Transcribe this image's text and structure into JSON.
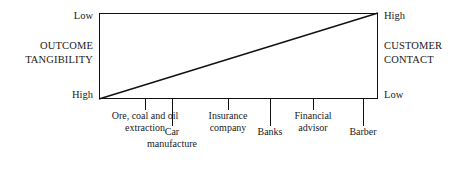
{
  "figure": {
    "axes": {
      "left": {
        "title_lines": [
          "OUTCOME",
          "TANGIBILITY"
        ],
        "top_label": "Low",
        "bottom_label": "High"
      },
      "right": {
        "title_lines": [
          "CUSTOMER",
          "CONTACT"
        ],
        "top_label": "High",
        "bottom_label": "Low"
      }
    },
    "categories": [
      {
        "lines": [
          "Ore, coal and oil",
          "extraction"
        ],
        "row": "upper",
        "x": 145,
        "tick": "short"
      },
      {
        "lines": [
          "Car",
          "manufacture"
        ],
        "row": "lower",
        "x": 172,
        "tick": "long"
      },
      {
        "lines": [
          "Insurance",
          "company"
        ],
        "row": "upper",
        "x": 228,
        "tick": "short"
      },
      {
        "lines": [
          "Banks"
        ],
        "row": "lower",
        "x": 270,
        "tick": "long"
      },
      {
        "lines": [
          "Financial",
          "advisor"
        ],
        "row": "upper",
        "x": 313,
        "tick": "short"
      },
      {
        "lines": [
          "Barber"
        ],
        "row": "lower",
        "x": 363,
        "tick": "long"
      }
    ],
    "colors": {
      "line": "#111111",
      "background": "#ffffff",
      "text": "#1a1a1a"
    }
  },
  "chart_data": {
    "type": "line",
    "title": "",
    "xlabel": "",
    "ylabel": "OUTCOME TANGIBILITY",
    "y2label": "CUSTOMER CONTACT",
    "grid": false,
    "legend": null,
    "ylim": [
      "High",
      "Low"
    ],
    "y2lim": [
      "Low",
      "High"
    ],
    "categories": [
      "Ore, coal and oil extraction",
      "Car manufacture",
      "Insurance company",
      "Banks",
      "Financial advisor",
      "Barber"
    ],
    "series": [
      {
        "name": "Outcome tangibility / customer contact trade-off",
        "x": [
          0,
          1
        ],
        "y": [
          0,
          1
        ],
        "annotation": "Straight diagonal from bottom-left (high outcome tangibility, low customer contact) to top-right (low outcome tangibility, high customer contact)"
      }
    ]
  }
}
